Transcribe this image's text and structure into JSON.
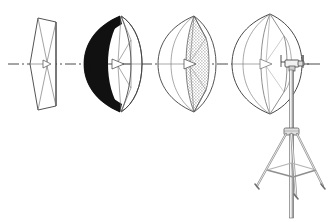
{
  "illustration": {
    "title": "Photographic Umbrella Progression with Light Stand",
    "background_color": "#ffffff",
    "line_color": "#3a3a3a",
    "fill_black": "#111111",
    "stipple_color": "#9a9a9a",
    "canvas": {
      "width": 335,
      "height": 222
    },
    "axis": {
      "name": "optical-center-axis",
      "style": "dash-dot",
      "y": 64,
      "x_start": 8,
      "x_end": 320,
      "color": "#4a4a4a"
    },
    "umbrellas": [
      {
        "index": 1,
        "label": "closed-flat-umbrella",
        "state": "nearly closed / flat profile",
        "shaft_x": 44,
        "center_y": 64,
        "half_height": 47,
        "depth": 16,
        "fabric": "white",
        "ribs": 6
      },
      {
        "index": 2,
        "label": "black-backed-umbrella",
        "state": "partially open, black outer shell",
        "shaft_x": 118,
        "center_y": 64,
        "half_height": 48,
        "depth": 40,
        "fabric": "black outer / white inner",
        "ribs": 6
      },
      {
        "index": 3,
        "label": "translucent-stippled-umbrella",
        "state": "open, translucent shoot-through panel",
        "shaft_x": 192,
        "center_y": 64,
        "half_height": 48,
        "depth": 52,
        "fabric": "white with stipple texture",
        "ribs": 6
      },
      {
        "index": 4,
        "label": "open-white-umbrella-mounted",
        "state": "fully open, mounted on stand",
        "shaft_x": 268,
        "center_y": 64,
        "half_height": 48,
        "depth": 56,
        "fabric": "white",
        "ribs": 6
      }
    ],
    "light_stand": {
      "label": "light-stand-tripod",
      "bracket": {
        "label": "umbrella-mount-bracket",
        "x": 281,
        "y": 56,
        "width": 26,
        "height": 14
      },
      "column": {
        "label": "center-column",
        "top_y": 66,
        "bottom_y": 218,
        "x": 290,
        "width": 4
      },
      "collar": {
        "label": "leg-collar-hub",
        "x": 290,
        "y": 128,
        "width": 16,
        "height": 8
      },
      "legs": 3,
      "braces": 3,
      "foot_y": 190
    }
  }
}
